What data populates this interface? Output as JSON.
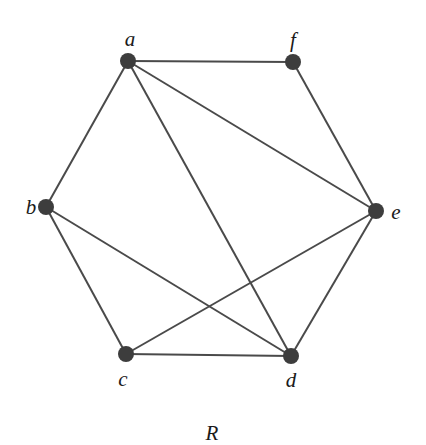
{
  "graph": {
    "caption": "R",
    "nodes": [
      {
        "id": "a",
        "label": "a",
        "x": 128,
        "y": 61,
        "lx": 130,
        "ly": 46,
        "anchor": "middle"
      },
      {
        "id": "f",
        "label": "f",
        "x": 293,
        "y": 62,
        "lx": 293,
        "ly": 47,
        "anchor": "middle"
      },
      {
        "id": "b",
        "label": "b",
        "x": 46,
        "y": 207,
        "lx": 31,
        "ly": 214,
        "anchor": "middle"
      },
      {
        "id": "e",
        "label": "e",
        "x": 376,
        "y": 211,
        "lx": 396,
        "ly": 219,
        "anchor": "middle"
      },
      {
        "id": "c",
        "label": "c",
        "x": 126,
        "y": 354,
        "lx": 123,
        "ly": 386,
        "anchor": "middle"
      },
      {
        "id": "d",
        "label": "d",
        "x": 291,
        "y": 356,
        "lx": 291,
        "ly": 387,
        "anchor": "middle"
      }
    ],
    "edges": [
      [
        "a",
        "f"
      ],
      [
        "a",
        "b"
      ],
      [
        "a",
        "e"
      ],
      [
        "a",
        "d"
      ],
      [
        "f",
        "e"
      ],
      [
        "b",
        "c"
      ],
      [
        "b",
        "d"
      ],
      [
        "e",
        "c"
      ],
      [
        "e",
        "d"
      ],
      [
        "c",
        "d"
      ]
    ],
    "caption_pos": {
      "x": 212,
      "y": 440
    }
  }
}
